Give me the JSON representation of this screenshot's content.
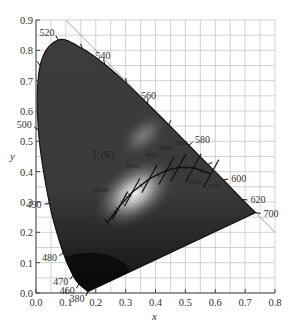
{
  "chart_data": {
    "type": "scatter",
    "title": "",
    "subtitle": "CIE 1931 chromaticity diagram with Planckian locus",
    "xlabel": "x",
    "ylabel": "y",
    "xlim": [
      0.0,
      0.8
    ],
    "ylim": [
      0.0,
      0.9
    ],
    "grid": true,
    "grid_spacing": 0.05,
    "x_ticks": [
      "0.0",
      "0.1",
      "0.2",
      "0.3",
      "0.4",
      "0.5",
      "0.6",
      "0.7",
      "0.8"
    ],
    "y_ticks": [
      "0.0",
      "0.1",
      "0.2",
      "0.3",
      "0.4",
      "0.5",
      "0.6",
      "0.7",
      "0.8",
      "0.9"
    ],
    "spectral_locus": {
      "name": "Spectral locus (nm)",
      "points": [
        {
          "nm": 380,
          "x": 0.174,
          "y": 0.005,
          "label": "380"
        },
        {
          "nm": 460,
          "x": 0.144,
          "y": 0.03,
          "label": "460"
        },
        {
          "nm": 470,
          "x": 0.124,
          "y": 0.058,
          "label": "470"
        },
        {
          "nm": 480,
          "x": 0.091,
          "y": 0.133,
          "label": "480"
        },
        {
          "nm": 490,
          "x": 0.045,
          "y": 0.295,
          "label": "490"
        },
        {
          "nm": 500,
          "x": 0.008,
          "y": 0.538,
          "label": "500"
        },
        {
          "nm": 510,
          "x": 0.014,
          "y": 0.75,
          "label": ""
        },
        {
          "nm": 520,
          "x": 0.074,
          "y": 0.834,
          "label": "520"
        },
        {
          "nm": 530,
          "x": 0.155,
          "y": 0.806,
          "label": ""
        },
        {
          "nm": 540,
          "x": 0.23,
          "y": 0.754,
          "label": "540"
        },
        {
          "nm": 550,
          "x": 0.302,
          "y": 0.692,
          "label": ""
        },
        {
          "nm": 560,
          "x": 0.373,
          "y": 0.624,
          "label": "560"
        },
        {
          "nm": 570,
          "x": 0.444,
          "y": 0.555,
          "label": ""
        },
        {
          "nm": 580,
          "x": 0.512,
          "y": 0.487,
          "label": "580"
        },
        {
          "nm": 590,
          "x": 0.575,
          "y": 0.424,
          "label": ""
        },
        {
          "nm": 600,
          "x": 0.627,
          "y": 0.373,
          "label": "600"
        },
        {
          "nm": 620,
          "x": 0.691,
          "y": 0.308,
          "label": "620"
        },
        {
          "nm": 700,
          "x": 0.735,
          "y": 0.265,
          "label": "700"
        }
      ]
    },
    "planckian_locus": {
      "name": "Tc(K)",
      "label": "Tc(K)",
      "points": [
        {
          "T": "10000",
          "x": 0.281,
          "y": 0.288
        },
        {
          "T": "6000",
          "x": 0.322,
          "y": 0.332
        },
        {
          "T": "4000",
          "x": 0.38,
          "y": 0.377
        },
        {
          "T": "3000",
          "x": 0.437,
          "y": 0.404
        },
        {
          "T": "2500",
          "x": 0.477,
          "y": 0.414
        },
        {
          "T": "2000",
          "x": 0.527,
          "y": 0.413
        },
        {
          "T": "1500",
          "x": 0.586,
          "y": 0.393
        }
      ]
    },
    "reference_line": {
      "name": "x + y = 1",
      "from": [
        0.1,
        0.9
      ],
      "to": [
        0.8,
        0.2
      ]
    }
  },
  "labels": {
    "xlabel": "x",
    "ylabel": "y",
    "tc": "Tc(K)"
  },
  "colors": {
    "gamut_dark": "#1a1a1a",
    "gamut_mid": "#3a3a3a",
    "gamut_light": "#d8d8d8",
    "grid": "#c8c8c8",
    "axis": "#444444",
    "locus": "#111111",
    "ref_line": "#a8a8a8"
  }
}
